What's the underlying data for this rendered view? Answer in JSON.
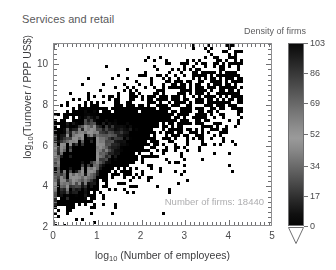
{
  "chart_data": {
    "type": "heatmap",
    "title": "Services and retail",
    "xlabel": "log10 (Number of employees)",
    "ylabel": "log10(Turnover / PPP US$)",
    "xlabel_parts": {
      "base": "log",
      "sub": "10",
      "rest": " (Number of employees)"
    },
    "ylabel_parts": {
      "base": "log",
      "sub": "10",
      "rest": "(Turnover / PPP US$)"
    },
    "xlim": [
      0,
      5
    ],
    "ylim": [
      2,
      11
    ],
    "xticks": [
      0,
      1,
      2,
      3,
      4,
      5
    ],
    "xtick_labels": [
      "0",
      "1",
      "2",
      "3",
      "4",
      "5"
    ],
    "yticks": [
      2,
      4,
      6,
      8,
      10
    ],
    "ytick_labels": [
      "2",
      "4",
      "6",
      "8",
      "10"
    ],
    "grid": false,
    "minor_ticks": true,
    "annotation": "Number of firms: 18440",
    "number_of_firms": 18440,
    "colorbar": {
      "label": "Density of firms",
      "ticks": [
        0,
        17,
        34,
        52,
        69,
        86,
        103
      ],
      "tick_labels": [
        "0",
        "17",
        "34",
        "52",
        "69",
        "86",
        "103"
      ],
      "vmin": 0,
      "vmax": 103,
      "position": "right",
      "orientation": "vertical",
      "has_underflow_arrow": true,
      "colormap": "inverted-gray-wrapped"
    },
    "colors": {
      "background": "#ffffff",
      "frame": "#8f8f91",
      "text": "#4a4a4c",
      "title": "#59595b",
      "annotation": "#aeaeb0",
      "data_dark": "#000000"
    },
    "density_peak_bin": {
      "x": 0.75,
      "y": 5.6,
      "value": 103
    },
    "trend": {
      "slope": 1.0,
      "intercept": 4.9
    },
    "stripe_x_positions": [
      0.0,
      0.301,
      0.477,
      0.602,
      0.699,
      0.778,
      0.845,
      0.903,
      0.954
    ],
    "series_summary": [
      {
        "name": "x-marginal-mode",
        "x": 0.7
      },
      {
        "name": "y-marginal-mode",
        "y": 5.5
      }
    ]
  }
}
